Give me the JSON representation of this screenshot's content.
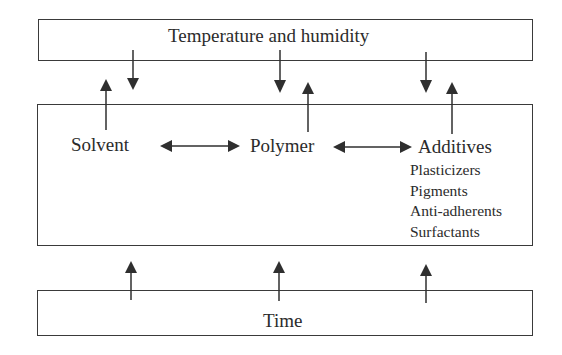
{
  "diagram": {
    "top_box": {
      "label": "Temperature and humidity"
    },
    "middle_box": {
      "components": [
        {
          "label": "Solvent"
        },
        {
          "label": "Polymer"
        },
        {
          "label": "Additives"
        }
      ],
      "additives_list": [
        "Plasticizers",
        "Pigments",
        "Anti-adherents",
        "Surfactants"
      ]
    },
    "bottom_box": {
      "label": "Time"
    },
    "colors": {
      "line": "#2f2f2f",
      "text": "#2b2b2b",
      "background": "#ffffff"
    }
  }
}
